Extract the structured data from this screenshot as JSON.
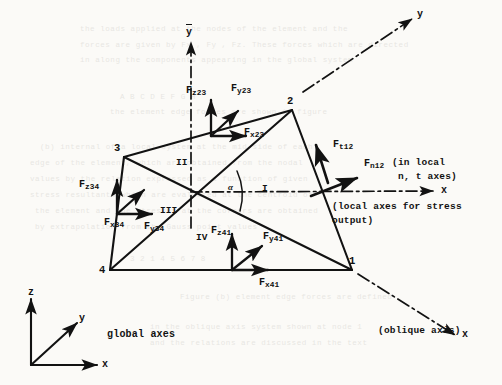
{
  "figure": {
    "type": "engineering-diagram",
    "nodes": [
      {
        "id": "node-1",
        "label": "1",
        "x": 352,
        "y": 261
      },
      {
        "id": "node-2",
        "label": "2",
        "x": 292,
        "y": 106
      },
      {
        "id": "node-3",
        "label": "3",
        "x": 118,
        "y": 150
      },
      {
        "id": "node-4",
        "label": "4",
        "x": 103,
        "y": 270
      }
    ],
    "subregions": [
      {
        "label": "I",
        "x": 264,
        "y": 190
      },
      {
        "label": "II",
        "x": 180,
        "y": 163
      },
      {
        "label": "III",
        "x": 168,
        "y": 212
      },
      {
        "label": "IV",
        "x": 200,
        "y": 238
      }
    ],
    "force_groups": [
      {
        "group": "edge-23",
        "labels": [
          {
            "name": "F_z23",
            "sym": "F",
            "sub": "z",
            "num": "23"
          },
          {
            "name": "F_y23",
            "sym": "F",
            "sub": "y",
            "num": "23"
          },
          {
            "name": "F_x23",
            "sym": "F",
            "sub": "x",
            "num": "23"
          }
        ]
      },
      {
        "group": "edge-34",
        "labels": [
          {
            "name": "F_z34",
            "sym": "F",
            "sub": "z",
            "num": "34"
          },
          {
            "name": "F_y34",
            "sym": "F",
            "sub": "y",
            "num": "34"
          },
          {
            "name": "F_x34",
            "sym": "F",
            "sub": "x",
            "num": "34"
          }
        ]
      },
      {
        "group": "edge-41",
        "labels": [
          {
            "name": "F_z41",
            "sym": "F",
            "sub": "z",
            "num": "41"
          },
          {
            "name": "F_y41",
            "sym": "F",
            "sub": "y",
            "num": "41"
          },
          {
            "name": "F_x41",
            "sym": "F",
            "sub": "x",
            "num": "41"
          }
        ]
      },
      {
        "group": "edge-12-local",
        "labels": [
          {
            "name": "F_t12",
            "sym": "F",
            "sub": "t",
            "num": "12"
          },
          {
            "name": "F_n12",
            "sym": "F",
            "sub": "n",
            "num": "12"
          }
        ]
      }
    ],
    "annotations": {
      "in_local_line1": "(in local",
      "in_local_line2": "n, t axes)",
      "local_axes_line1": "(local axes for stress",
      "local_axes_line2": "output)",
      "oblique_axis": "(oblique axis)",
      "global_axes": "global axes",
      "alpha": "α"
    },
    "axis_labels": {
      "ybar": "y",
      "oblique_y": "y",
      "oblique_x": "x",
      "local_x": "x",
      "global_z": "z",
      "global_y": "y",
      "global_x": "x"
    },
    "force_symbol": "F",
    "subscripts": {
      "z23": "z",
      "y23": "y",
      "x23": "x",
      "z34": "z",
      "y34": "y",
      "x34": "x",
      "z41": "z",
      "y41": "y",
      "x41": "x",
      "t12": "t",
      "n12": "n",
      "n23": "23",
      "n34": "34",
      "n41": "41",
      "n12num": "12"
    },
    "colors": {
      "ink": "#121212",
      "paper": "#fbfaf7"
    }
  },
  "ghost_text": {
    "lines": [
      {
        "text": "the loads  applied  at  the  nodes  of  the  element  and  the",
        "x": 80,
        "y": 22
      },
      {
        "text": "forces are  given  by  Fx , Fy , Fz.  These  forces  which  are  directed",
        "x": 80,
        "y": 38
      },
      {
        "text": "in along  the  components  appearing  in  the  global  system",
        "x": 80,
        "y": 53
      },
      {
        "text": "A      B      C      D      E      F      G      H",
        "x": 120,
        "y": 90
      },
      {
        "text": "the  element  edge  forces  are  shown  in  figure",
        "x": 110,
        "y": 105
      },
      {
        "text": "(b) internal  of  a  local  system  at  the  mid-side  of  each",
        "x": 40,
        "y": 140
      },
      {
        "text": "edge  of  the  element, which  are  obtained  from  the  nodal",
        "x": 30,
        "y": 156
      },
      {
        "text": "values  by  the  relation  expressed  as  a  function  of  given",
        "x": 30,
        "y": 172
      },
      {
        "text": "stress  resultants  which  are  evaluated  at  the  centroid  of",
        "x": 30,
        "y": 188
      },
      {
        "text": "the  element  and  the  stresses  at  the  corners  are  obtained",
        "x": 35,
        "y": 204
      },
      {
        "text": "by  extrapolation  from  the  Gauss  point  values",
        "x": 35,
        "y": 220
      },
      {
        "text": "3      2      1      4      5      6      7      8",
        "x": 130,
        "y": 252
      },
      {
        "text": "Figure (b)  element  edge  forces  are  defined",
        "x": 180,
        "y": 290
      },
      {
        "text": "in  the  oblique  axis  system  shown  at  node  1",
        "x": 150,
        "y": 320
      },
      {
        "text": "and  the  relations  are  discussed  in  the  text",
        "x": 150,
        "y": 336
      }
    ]
  }
}
